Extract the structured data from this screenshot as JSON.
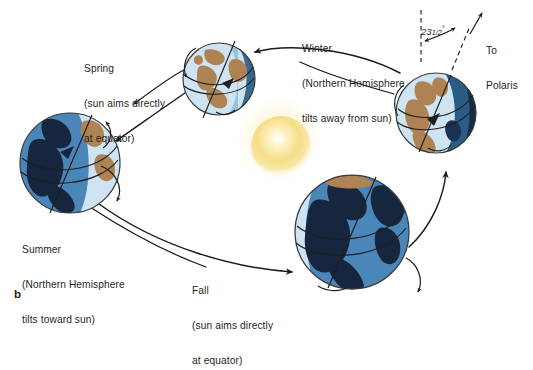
{
  "figure": {
    "label": "b",
    "kind": "earth-seasons-orbit-diagram"
  },
  "sun": {
    "name": "sun",
    "color_core": "#fffdf0",
    "color_mid": "#f7e08f",
    "color_edge": "#fdf6dc"
  },
  "annotations": {
    "tilt_value": "23",
    "tilt_fraction": "1/2",
    "tilt_degree": "°",
    "tilt_full": "23 1/2°",
    "polaris_line1": "To",
    "polaris_line2": "Polaris"
  },
  "seasons": [
    {
      "id": "spring",
      "line1": "Spring",
      "line2": "(sun aims directly",
      "line3": "at equator)",
      "ocean": "#cfe4f2",
      "land": "#ae8253",
      "shadow": "#2a5d86",
      "position": "top-left-of-sun"
    },
    {
      "id": "winter",
      "line1": "Winter",
      "line2": "(Northern Hemisphere",
      "line3": "tilts away from sun)",
      "ocean": "#cfe4f2",
      "land": "#ae8253",
      "shadow": "#21415e",
      "position": "right-of-sun"
    },
    {
      "id": "summer",
      "line1": "Summer",
      "line2": "(Northern Hemisphere",
      "line3": "tilts toward sun)",
      "ocean": "#4a86b8",
      "land": "#16263f",
      "shadow": "#2b5d86",
      "position": "left-of-sun"
    },
    {
      "id": "fall",
      "line1": "Fall",
      "line2": "(sun aims directly",
      "line3": "at equator)",
      "ocean": "#4a86b8",
      "land": "#16263f",
      "shadow": "#1d3css",
      "position": "bottom-right-of-sun"
    }
  ],
  "colors": {
    "background": "#ffffff",
    "text": "#231f20",
    "orbit_line": "#1a1a1a",
    "globe_outline": "#3a3a3a"
  }
}
